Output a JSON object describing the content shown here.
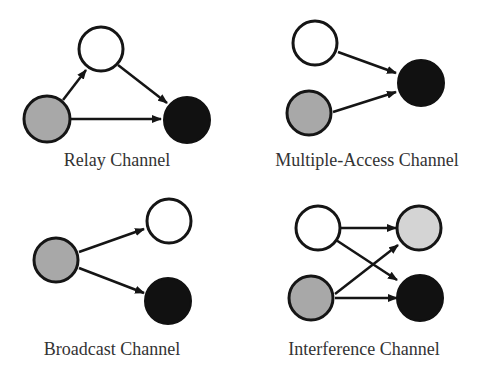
{
  "colors": {
    "source": "#a8a8a8",
    "relay_or_aux": "#ffffff",
    "destination": "#111111",
    "secondary_destination": "#d4d4d4",
    "stroke": "#151515",
    "label": "#333333"
  },
  "panels": [
    {
      "id": "relay",
      "label": "Relay Channel"
    },
    {
      "id": "mac",
      "label": "Multiple-Access Channel"
    },
    {
      "id": "broadcast",
      "label": "Broadcast Channel"
    },
    {
      "id": "interference",
      "label": "Interference Channel"
    }
  ]
}
